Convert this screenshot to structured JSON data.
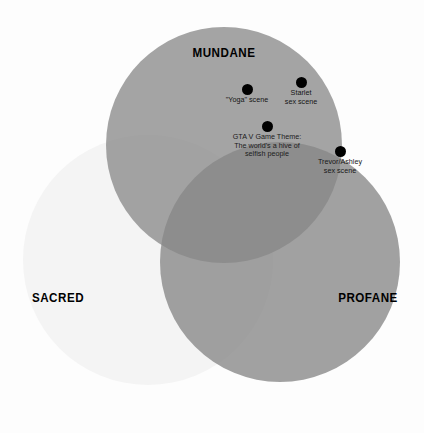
{
  "figure": {
    "type": "venn",
    "background_color": "#fdfdfd",
    "sets": [
      {
        "id": "mundane",
        "label": "MUNDANE",
        "color": "#8a8a8a",
        "cx": 224,
        "cy": 145,
        "r": 118,
        "label_x": 224,
        "label_y": 52
      },
      {
        "id": "sacred",
        "label": "SACRED",
        "color": "#f4f4f4",
        "cx": 148,
        "cy": 260,
        "r": 125,
        "label_x": 58,
        "label_y": 297
      },
      {
        "id": "profane",
        "label": "PROFANE",
        "color": "#878787",
        "cx": 280,
        "cy": 262,
        "r": 120,
        "label_x": 368,
        "label_y": 297
      }
    ],
    "items": [
      {
        "id": "yoga-scene",
        "dot_x": 247,
        "dot_y": 84,
        "lines": [
          "\"Yoga\" scene"
        ],
        "tone": "lbl-light"
      },
      {
        "id": "starlet-sex-scene",
        "dot_x": 301,
        "dot_y": 77,
        "lines": [
          "Starlet",
          "sex scene"
        ],
        "tone": "lbl-light"
      },
      {
        "id": "gta-v-game-theme",
        "dot_x": 267,
        "dot_y": 121,
        "lines": [
          "GTA V Game Theme:",
          "The world's a hive of",
          "selfish people"
        ],
        "tone": "lbl-dark"
      },
      {
        "id": "trevor-ashley-sex-scene",
        "dot_x": 340,
        "dot_y": 146,
        "lines": [
          "Trevor/Ashley",
          "sex scene"
        ],
        "tone": "lbl-mid"
      }
    ]
  }
}
